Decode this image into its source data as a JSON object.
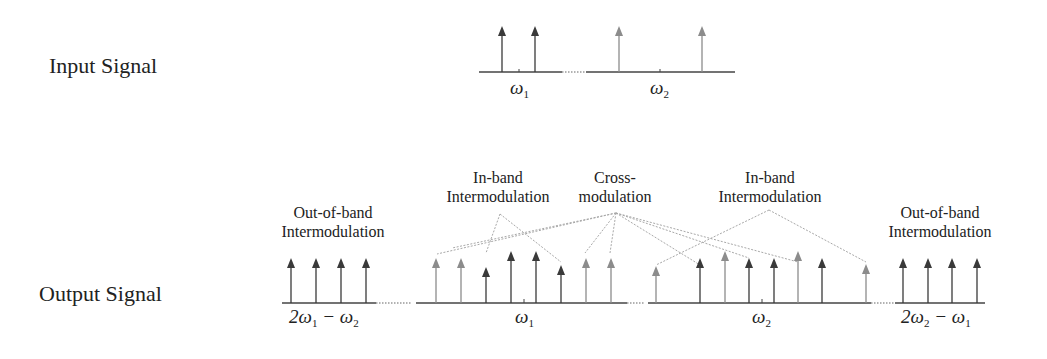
{
  "diagram": {
    "colors": {
      "dark_arrow": "#3a3a3a",
      "light_arrow": "#8c8c8c",
      "axis": "#444444",
      "connector": "#a8a8a8",
      "text": "#222222"
    },
    "input_signal": {
      "label": "Input Signal",
      "freq_labels": [
        {
          "symbol": "ω",
          "sub": "1"
        },
        {
          "symbol": "ω",
          "sub": "2"
        }
      ],
      "tones": [
        {
          "x": 502,
          "shade": "dark"
        },
        {
          "x": 535,
          "shade": "dark"
        },
        {
          "x": 619,
          "shade": "light"
        },
        {
          "x": 702,
          "shade": "light"
        }
      ]
    },
    "output_signal": {
      "label": "Output Signal",
      "freq_labels": [
        {
          "text": "2ω",
          "sub": "1",
          "rest": " − ω",
          "sub2": "2"
        },
        {
          "symbol": "ω",
          "sub": "1"
        },
        {
          "symbol": "ω",
          "sub": "2"
        },
        {
          "text": "2ω",
          "sub": "2",
          "rest": " − ω",
          "sub2": "1"
        }
      ],
      "annotations": [
        {
          "id": "oob-left",
          "line1": "Out-of-band",
          "line2": "Intermodulation"
        },
        {
          "id": "inband-left",
          "line1": "In-band",
          "line2": "Intermodulation"
        },
        {
          "id": "cross",
          "line1": "Cross-",
          "line2": "modulation"
        },
        {
          "id": "inband-right",
          "line1": "In-band",
          "line2": "Intermodulation"
        },
        {
          "id": "oob-right",
          "line1": "Out-of-band",
          "line2": "Intermodulation"
        }
      ]
    }
  }
}
